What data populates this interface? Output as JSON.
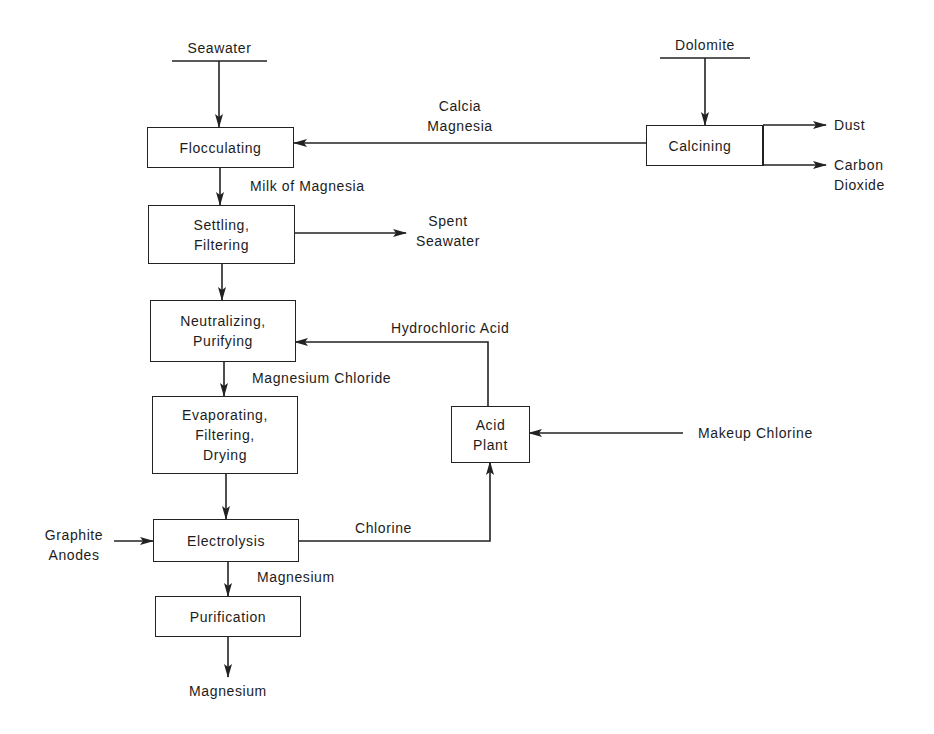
{
  "diagram": {
    "type": "process-flowchart",
    "inputs": {
      "seawater": "Seawater",
      "dolomite": "Dolomite",
      "graphite_anodes": [
        "Graphite",
        "Anodes"
      ],
      "makeup_chlorine": "Makeup Chlorine"
    },
    "processes": {
      "flocculating": [
        "Flocculating"
      ],
      "calcining": [
        "Calcining"
      ],
      "settling": [
        "Settling,",
        "Filtering"
      ],
      "neutralizing": [
        "Neutralizing,",
        "Purifying"
      ],
      "evaporating": [
        "Evaporating,",
        "Filtering,",
        "Drying"
      ],
      "electrolysis": [
        "Electrolysis"
      ],
      "purification": [
        "Purification"
      ],
      "acid_plant": [
        "Acid",
        "Plant"
      ]
    },
    "streams": {
      "calcia_magnesia": [
        "Calcia",
        "Magnesia"
      ],
      "dust": "Dust",
      "carbon_dioxide": [
        "Carbon",
        "Dioxide"
      ],
      "milk_of_magnesia": "Milk of Magnesia",
      "spent_seawater": [
        "Spent",
        "Seawater"
      ],
      "hydrochloric_acid": "Hydrochloric Acid",
      "magnesium_chloride": "Magnesium Chloride",
      "chlorine": "Chlorine",
      "magnesium_intermediate": "Magnesium",
      "magnesium_output": "Magnesium"
    },
    "edges": [
      {
        "from": "Seawater",
        "to": "Flocculating"
      },
      {
        "from": "Dolomite",
        "to": "Calcining"
      },
      {
        "from": "Calcining",
        "to": "Flocculating",
        "label": "Calcia Magnesia"
      },
      {
        "from": "Calcining",
        "to": "Dust"
      },
      {
        "from": "Calcining",
        "to": "Carbon Dioxide"
      },
      {
        "from": "Flocculating",
        "to": "Settling, Filtering",
        "label": "Milk of Magnesia"
      },
      {
        "from": "Settling, Filtering",
        "to": "Spent Seawater"
      },
      {
        "from": "Settling, Filtering",
        "to": "Neutralizing, Purifying"
      },
      {
        "from": "Acid Plant",
        "to": "Neutralizing, Purifying",
        "label": "Hydrochloric Acid"
      },
      {
        "from": "Neutralizing, Purifying",
        "to": "Evaporating, Filtering, Drying",
        "label": "Magnesium Chloride"
      },
      {
        "from": "Makeup Chlorine",
        "to": "Acid Plant"
      },
      {
        "from": "Evaporating, Filtering, Drying",
        "to": "Electrolysis"
      },
      {
        "from": "Graphite Anodes",
        "to": "Electrolysis"
      },
      {
        "from": "Electrolysis",
        "to": "Acid Plant",
        "label": "Chlorine"
      },
      {
        "from": "Electrolysis",
        "to": "Purification",
        "label": "Magnesium"
      },
      {
        "from": "Purification",
        "to": "Magnesium"
      }
    ]
  }
}
